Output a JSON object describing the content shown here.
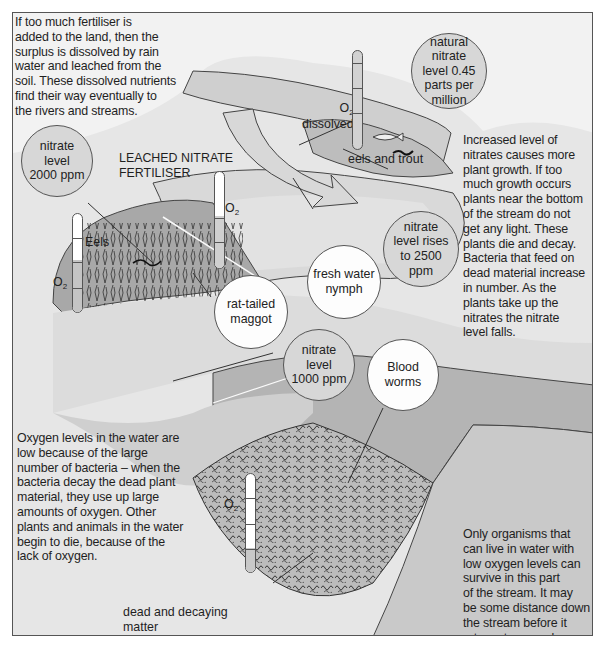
{
  "colors": {
    "background": "#ffffff",
    "frame_fill": "#e9e9e9",
    "water_light": "#f4f4f4",
    "water_mid": "#d3d3d3",
    "bank_dark": "#a9a9a9",
    "line": "#444444"
  },
  "paragraphs": {
    "intro": "If too much fertiliser is added to the land, then the surplus is dissolved by rain water and leached from the soil. These dissolved nutrients find their way eventually to the rivers and streams.",
    "plant_growth": "Increased level of nitrates causes more plant growth. If too much growth occurs plants near the bottom of the stream do not get any light. These plants die and decay. Bacteria that feed on dead material increase in number. As the plants take up the nitrates the nitrate level falls.",
    "oxygen_low": "Oxygen levels in the water are low because of the large number of bacteria – when the bacteria decay the dead plant material, they use up large amounts of oxygen. Other plants and animals in the water begin to die, because of the lack of oxygen.",
    "recovery": "Only organisms that can live in water with low oxygen levels can survive in this part of the stream. It may be some distance down the stream before it returns to normal."
  },
  "paragraph_lines": {
    "intro": [
      "If too much fertiliser is",
      "added to the land, then the",
      "surplus is dissolved by rain",
      "water and leached from the",
      "soil. These dissolved nutrients",
      "find their way eventually to",
      "the rivers and streams."
    ],
    "plant_growth": [
      "Increased level of",
      "nitrates causes more",
      "plant growth. If too",
      "much growth occurs",
      "plants near the bottom",
      "of the stream do not",
      "get any light. These",
      "plants die and decay.",
      "Bacteria that feed on",
      "dead material increase",
      "in number. As the",
      "plants take up the",
      "nitrates the nitrate",
      "level falls."
    ],
    "oxygen_low": [
      "Oxygen levels in the water are",
      "low because of the large",
      "number of bacteria – when the",
      "bacteria decay the dead plant",
      "material, they use up large",
      "amounts of oxygen. Other",
      "plants and animals in the water",
      "begin to die, because of the",
      "lack of oxygen."
    ],
    "recovery": [
      "Only organisms that",
      "can live in water with",
      "low oxygen levels can",
      "survive in this part",
      "of the stream. It may",
      "be some distance down",
      "the stream before it",
      "returns to normal."
    ]
  },
  "bubbles": [
    {
      "id": "natural-nitrate",
      "lines": [
        "natural",
        "nitrate",
        "level 0.45",
        "parts per",
        "million"
      ],
      "style": "grey"
    },
    {
      "id": "nitrate-2000",
      "lines": [
        "nitrate",
        "level",
        "2000 ppm"
      ],
      "style": "grey"
    },
    {
      "id": "nitrate-2500",
      "lines": [
        "nitrate",
        "level rises",
        "to 2500",
        "ppm"
      ],
      "style": "grey"
    },
    {
      "id": "fresh-water-nymph",
      "lines": [
        "fresh water",
        "nymph"
      ],
      "style": "white"
    },
    {
      "id": "rat-tailed-maggot",
      "lines": [
        "rat-tailed",
        "maggot"
      ],
      "style": "white"
    },
    {
      "id": "nitrate-1000",
      "lines": [
        "nitrate",
        "level",
        "1000 ppm"
      ],
      "style": "grey"
    },
    {
      "id": "blood-worms",
      "lines": [
        "Blood",
        "worms"
      ],
      "style": "white"
    }
  ],
  "labels": {
    "leached_line1": "LEACHED NITRATE",
    "leached_line2": "FERTILISER",
    "eels_and_trout": "eels and trout",
    "eels": "Eels",
    "dissolved": "dissolved",
    "o2_symbol": "O",
    "o2_subscript": "2",
    "dead_matter_line1": "dead and decaying",
    "dead_matter_line2": "matter"
  },
  "oxygen_gauges": [
    {
      "location": "upstream",
      "fill_percent": 0,
      "ticks": 3
    },
    {
      "location": "leaching-point",
      "fill_percent": 0,
      "ticks": 1
    },
    {
      "location": "weed-growth",
      "fill_percent": 0,
      "ticks": 3
    },
    {
      "location": "decay-zone",
      "fill_percent": 25,
      "ticks": 3
    }
  ]
}
